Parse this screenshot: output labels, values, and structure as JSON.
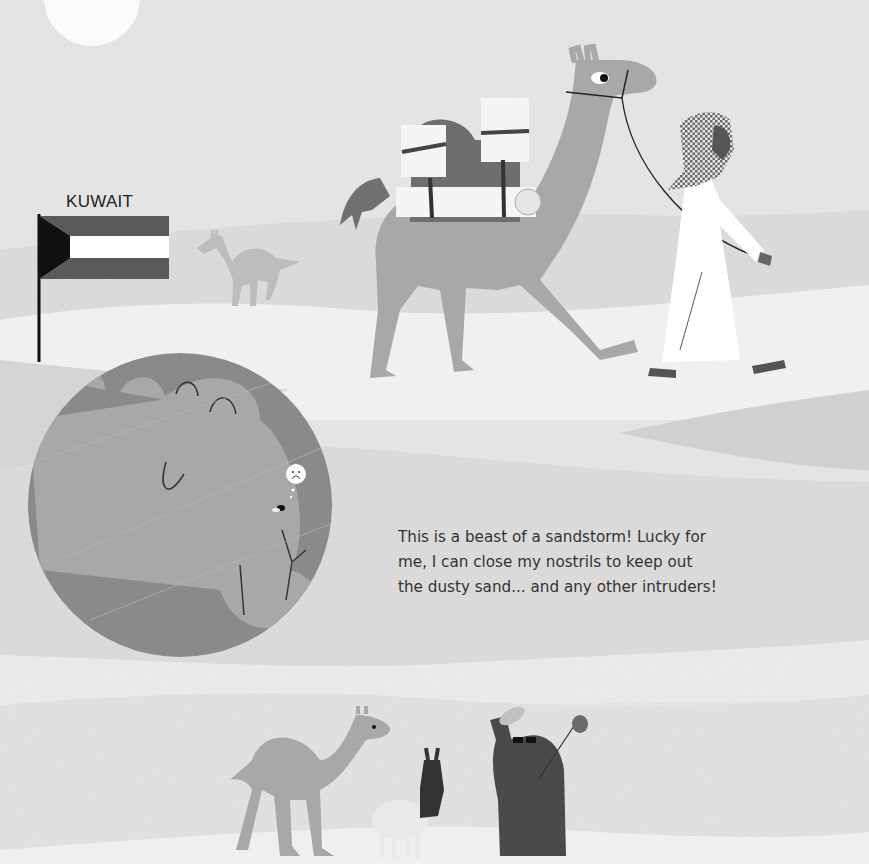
{
  "page": {
    "style": "grayscale illustrated children's book page",
    "colors": {
      "sky": "#e6e6e6",
      "dune_light": "#f2f2f2",
      "dune_mid": "#d9d9d9",
      "dune_dark": "#cfcfcf",
      "camel": "#a8a8a8",
      "camel_dark": "#8f8f8f",
      "saddle": "#6e6e6e",
      "robe": "#ffffff",
      "bear": "#4a4a4a",
      "inset_bg": "#8a8a8a",
      "text": "#333333"
    }
  },
  "flag": {
    "country_label": "KUWAIT",
    "stripes": [
      "#5a5a5a",
      "#ffffff",
      "#5a5a5a"
    ],
    "hoist_triangle": "#111111"
  },
  "caption": {
    "lines": [
      "This is a beast of a sandstorm! Lucky for",
      "me, I can close my nostrils to keep out",
      "the dusty sand... and any other intruders!"
    ]
  },
  "illustrations": {
    "sun": "white-sun-partial",
    "main_scene": [
      "loaded-camel",
      "man-in-keffiyeh-leading-camel",
      "distant-camel"
    ],
    "inset": [
      "camel-face-closed-nostril",
      "fly",
      "sad-face-thought-bubble"
    ],
    "bottom_scene": [
      "dromedary-camel",
      "llama",
      "bear-with-hat-and-sunglasses",
      "bindle-bag"
    ]
  }
}
